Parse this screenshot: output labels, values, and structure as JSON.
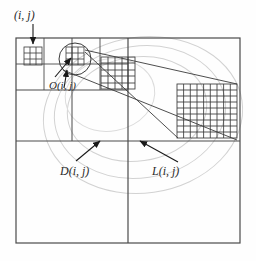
{
  "figure": {
    "name": "quadtree-magnification-diagram",
    "type": "diagram",
    "background_color": "#fefefe",
    "line_color": "#3a3a3a",
    "ellipse_color": "#cfcfcf",
    "text_color": "#2b2b2b"
  },
  "labels": {
    "cell_ij": "(i, j)",
    "octant_oij": "O(i, j)",
    "domain_dij": "D(i, j)",
    "level_lij": "L(i, j)"
  },
  "structure": {
    "outer_frame": {
      "x": 16,
      "y": 38,
      "width": 224,
      "height": 205
    },
    "quadrant_split": {
      "vertical_x": 128,
      "horizontal_y": 141
    },
    "upper_left_quadrant": {
      "x": 16,
      "y": 38,
      "width": 112,
      "height": 103
    },
    "subdivision_levels": 3,
    "grids": [
      {
        "name": "small-grid-left",
        "cells": 3,
        "x": 24,
        "y": 47,
        "size": 18
      },
      {
        "name": "small-grid-right",
        "cells": 3,
        "x": 65,
        "y": 47,
        "size": 18
      },
      {
        "name": "medium-grid-callout",
        "cells": 5,
        "x": 101,
        "y": 57,
        "size": 33
      },
      {
        "name": "large-grid-callout",
        "cells": 9,
        "x": 177,
        "y": 84,
        "size": 54
      }
    ],
    "magnifier_circle": {
      "cx": 74,
      "cy": 60,
      "r": 15
    },
    "ellipses": [
      {
        "cx": 143,
        "cy": 115,
        "rx": 100,
        "ry": 78,
        "rotation": -8
      },
      {
        "cx": 140,
        "cy": 112,
        "rx": 86,
        "ry": 66,
        "rotation": -8
      },
      {
        "cx": 138,
        "cy": 110,
        "rx": 70,
        "ry": 52,
        "rotation": -8
      }
    ],
    "arrows": [
      {
        "name": "arrow-ij",
        "from": [
          33,
          22
        ],
        "to": [
          33,
          46
        ]
      },
      {
        "name": "arrow-oij-up",
        "from": [
          63,
          86
        ],
        "to": [
          66,
          69
        ]
      },
      {
        "name": "arrow-oij-diag",
        "from": [
          54,
          76
        ],
        "to": [
          72,
          56
        ]
      },
      {
        "name": "arrow-dij",
        "from": [
          79,
          161
        ],
        "to": [
          101,
          141
        ]
      },
      {
        "name": "arrow-lij",
        "from": [
          175,
          161
        ],
        "to": [
          140,
          140
        ]
      }
    ],
    "callout_lines": [
      {
        "from": [
          82,
          52
        ],
        "to": [
          243,
          84
        ]
      },
      {
        "from": [
          62,
          70
        ],
        "to": [
          243,
          138
        ]
      }
    ]
  }
}
